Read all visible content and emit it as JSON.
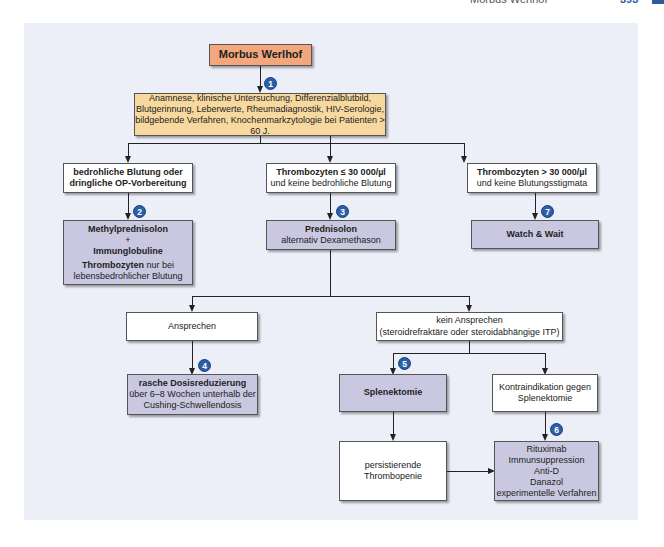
{
  "page_header": {
    "running_title": "Morbus Werlhof",
    "page_number": "393"
  },
  "colors": {
    "panel_bg": "#eceff7",
    "root_box": "#f2a77c",
    "diagnostic_box": "#f7d9a0",
    "therapy_box": "#c9c8e0",
    "badge": "#2b5fa8"
  },
  "diagram": {
    "root": {
      "label": "Morbus Werlhof"
    },
    "diagnostics": {
      "badge": "1",
      "lines": [
        "Anamnese, klinische Untersuchung, Differenzialblutbild,",
        "Blutgerinnung, Leberwerte, Rheumadiagnostik, HIV-Serologie,",
        "bildgebende Verfahren, Knochenmarkzytologie bei Patienten > 60 J."
      ]
    },
    "conditions": [
      {
        "line1": "bedrohliche Blutung oder",
        "line2": "dringliche OP-Vorbereitung"
      },
      {
        "line1": "Thrombozyten ≤ 30 000/µl",
        "line2": "und keine bedrohliche Blutung"
      },
      {
        "line1": "Thrombozyten > 30 000/µl",
        "line2": "und keine Blutungsstigmata"
      }
    ],
    "therapies": {
      "methylprednisolon": {
        "badge": "2",
        "line1": "Methylprednisolon",
        "plus": "+",
        "line2": "Immunglobuline",
        "line3_bold": "Thrombozyten",
        "line3_rest": " nur bei",
        "line4": "lebensbedrohlicher Blutung"
      },
      "prednisolon": {
        "badge": "3",
        "line1": "Prednisolon",
        "line2": "alternativ Dexamethason"
      },
      "watch_wait": {
        "badge": "7",
        "label": "Watch & Wait"
      }
    },
    "response": {
      "label": "Ansprechen"
    },
    "no_response": {
      "line1": "kein Ansprechen",
      "line2": "(steroidrefraktäre oder steroidabhängige ITP)"
    },
    "dose_reduction": {
      "badge": "4",
      "line1": "rasche Dosisreduzierung",
      "line2": "über 6–8 Wochen unterhalb der",
      "line3": "Cushing-Schwellendosis"
    },
    "splenectomy": {
      "badge": "5",
      "label": "Splenektomie"
    },
    "contraindication": {
      "line1": "Kontraindikation gegen",
      "line2": "Splenektomie"
    },
    "persistent": {
      "line1": "persistierende",
      "line2": "Thrombopenie"
    },
    "second_line": {
      "badge": "6",
      "items": [
        "Rituximab",
        "Immunsuppression",
        "Anti-D",
        "Danazol",
        "experimentelle Verfahren"
      ]
    }
  }
}
